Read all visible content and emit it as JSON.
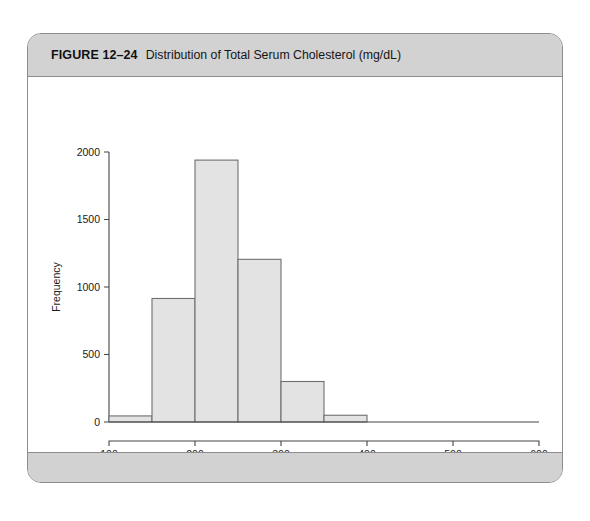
{
  "figure": {
    "label": "FIGURE 12–24",
    "caption": "Distribution of Total Serum Cholesterol (mg/dL)"
  },
  "chart_data": {
    "type": "bar",
    "title": "",
    "xlabel": "Total Serum Cholesterol",
    "ylabel": "Frequency",
    "categories": [
      "100–150",
      "150–200",
      "200–250",
      "250–300",
      "300–350",
      "350–400"
    ],
    "bin_edges": [
      100,
      150,
      200,
      250,
      300,
      350,
      400
    ],
    "values": [
      45,
      915,
      1940,
      1205,
      300,
      50
    ],
    "xlim": [
      100,
      600
    ],
    "ylim": [
      0,
      2000
    ],
    "xticks": [
      100,
      200,
      300,
      400,
      500,
      600
    ],
    "xtick_labels": [
      "100",
      "200",
      "300",
      "400",
      "500",
      "600"
    ],
    "yticks": [
      0,
      500,
      1000,
      1500,
      2000
    ],
    "ytick_labels": [
      "0",
      "500",
      "1000",
      "1500",
      "2000"
    ],
    "grid": false,
    "legend": null,
    "bar_fill": "#e3e3e3",
    "bar_stroke": "#6f6f6f",
    "axis_color": "#444444"
  }
}
